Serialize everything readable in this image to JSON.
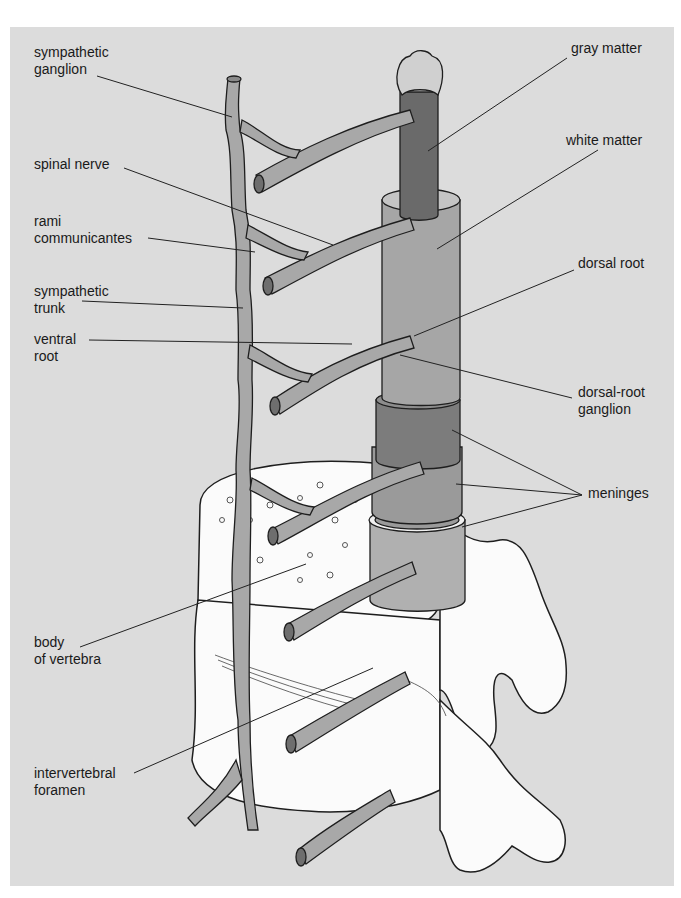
{
  "figure": {
    "panel_color": "#dcdcdc",
    "colors": {
      "nerve": "#a8a8a8",
      "nerve_dark": "#6e6e6e",
      "gray_matter": "#6a6a6a",
      "white_matter": "#a6a6a6",
      "meninges_outer": "#8c8c8c",
      "meninges_mid": "#9a9a9a",
      "meninges_inner": "#b0b0b0",
      "bone": "#fbfbfb",
      "outline": "#1e1e1e"
    }
  },
  "labels": [
    {
      "id": "sympathetic-ganglion",
      "lines": [
        "sympathetic",
        "ganglion"
      ],
      "x": 34,
      "y": 44,
      "leader": [
        [
          97,
          76
        ],
        [
          232,
          117
        ]
      ]
    },
    {
      "id": "spinal-nerve",
      "lines": [
        "spinal nerve"
      ],
      "x": 34,
      "y": 156,
      "leader": [
        [
          124,
          168
        ],
        [
          333,
          245
        ]
      ]
    },
    {
      "id": "rami-communicantes",
      "lines": [
        "rami",
        "communicantes"
      ],
      "x": 34,
      "y": 213,
      "leader": [
        [
          148,
          238
        ],
        [
          255,
          252
        ]
      ]
    },
    {
      "id": "sympathetic-trunk",
      "lines": [
        "sympathetic",
        "trunk"
      ],
      "x": 34,
      "y": 283,
      "leader": [
        [
          82,
          301
        ],
        [
          243,
          308
        ]
      ]
    },
    {
      "id": "ventral-root",
      "lines": [
        "ventral",
        "root"
      ],
      "x": 34,
      "y": 331,
      "leader": [
        [
          89,
          340
        ],
        [
          352,
          344
        ]
      ]
    },
    {
      "id": "body-of-vertebra",
      "lines": [
        "body",
        "of vertebra"
      ],
      "x": 34,
      "y": 634,
      "leader": [
        [
          80,
          647
        ],
        [
          306,
          564
        ]
      ]
    },
    {
      "id": "intervertebral-foramen",
      "lines": [
        "intervertebral",
        "foramen"
      ],
      "x": 34,
      "y": 765,
      "leader": [
        [
          134,
          773
        ],
        [
          373,
          668
        ]
      ]
    },
    {
      "id": "gray-matter",
      "lines": [
        "gray matter"
      ],
      "x": 571,
      "y": 40,
      "leader": [
        [
          567,
          58
        ],
        [
          428,
          151
        ]
      ]
    },
    {
      "id": "white-matter",
      "lines": [
        "white matter"
      ],
      "x": 566,
      "y": 132,
      "leader": [
        [
          598,
          150
        ],
        [
          437,
          249
        ]
      ]
    },
    {
      "id": "dorsal-root",
      "lines": [
        "dorsal root"
      ],
      "x": 578,
      "y": 255,
      "leader": [
        [
          574,
          270
        ],
        [
          414,
          336
        ]
      ]
    },
    {
      "id": "dorsal-root-ganglion",
      "lines": [
        "dorsal-root",
        "ganglion"
      ],
      "x": 578,
      "y": 384,
      "leader": [
        [
          572,
          398
        ],
        [
          400,
          355
        ]
      ]
    },
    {
      "id": "meninges",
      "lines": [
        "meninges"
      ],
      "x": 588,
      "y": 485,
      "leader": [
        [
          582,
          495
        ],
        [
          452,
          430
        ]
      ],
      "leaders_extra": [
        [
          [
            582,
            495
          ],
          [
            456,
            484
          ]
        ],
        [
          [
            582,
            495
          ],
          [
            462,
            527
          ]
        ]
      ]
    }
  ]
}
